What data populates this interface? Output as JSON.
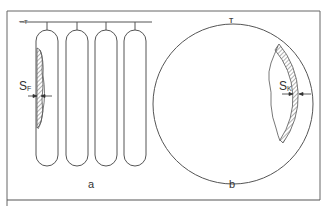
{
  "figure": {
    "panel_a": {
      "caption": "a",
      "thickness_label": "S",
      "thickness_subscript": "F",
      "tube_count": 4,
      "description": "four parallel tubes hanging from a header pipe, first tube with hatched wall deposit"
    },
    "panel_b": {
      "caption": "b",
      "thickness_label": "S",
      "thickness_subscript": "K",
      "description": "circular vessel with hatched wall layer on right side"
    },
    "colors": {
      "line": "#555555",
      "hatch": "#777777",
      "background": "#ffffff"
    }
  }
}
